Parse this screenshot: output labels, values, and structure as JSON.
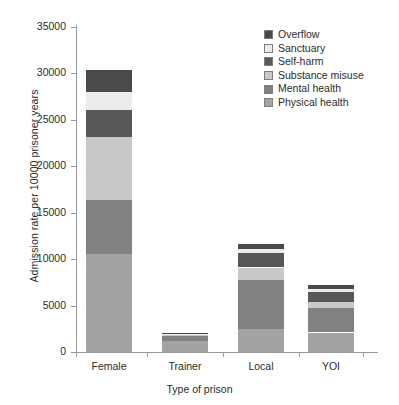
{
  "chart_data": {
    "type": "bar",
    "stacked": true,
    "title": "",
    "xlabel": "Type of prison",
    "ylabel": "Admission rate per 10000 prisoner years",
    "categories": [
      "Female",
      "Trainer",
      "Local",
      "YOI"
    ],
    "ylim": [
      0,
      35000
    ],
    "yticks": [
      0,
      5000,
      10000,
      15000,
      20000,
      25000,
      30000,
      35000
    ],
    "ytick_labels": [
      "0",
      "5000",
      "10000",
      "15000",
      "20000",
      "25000",
      "30000",
      "35000"
    ],
    "grid": false,
    "legend_position": "top-right",
    "legend_order_top_to_bottom": [
      "Overflow",
      "Sanctuary",
      "Self-harm",
      "Substance misuse",
      "Mental health",
      "Physical health"
    ],
    "stack_order_bottom_to_top": [
      "Physical health",
      "Mental health",
      "Substance misuse",
      "Self-harm",
      "Sanctuary",
      "Overflow"
    ],
    "series": [
      {
        "name": "Physical health",
        "color": "#a3a3a3",
        "values": [
          10600,
          1150,
          2500,
          2100
        ]
      },
      {
        "name": "Mental health",
        "color": "#828282",
        "values": [
          5800,
          550,
          5300,
          2600
        ]
      },
      {
        "name": "Substance misuse",
        "color": "#c8c8c8",
        "values": [
          6800,
          200,
          1300,
          700
        ]
      },
      {
        "name": "Self-harm",
        "color": "#585858",
        "values": [
          2900,
          60,
          1600,
          1100
        ]
      },
      {
        "name": "Sanctuary",
        "color": "#ececec",
        "values": [
          1900,
          20,
          400,
          300
        ]
      },
      {
        "name": "Overflow",
        "color": "#4a4a4a",
        "values": [
          2400,
          20,
          500,
          400
        ]
      }
    ],
    "totals": [
      30400,
      2000,
      11600,
      7200
    ]
  },
  "legend": {
    "items": [
      {
        "label": "Overflow",
        "color": "#4a4a4a"
      },
      {
        "label": "Sanctuary",
        "color": "#ececec"
      },
      {
        "label": "Self-harm",
        "color": "#585858"
      },
      {
        "label": "Substance misuse",
        "color": "#c8c8c8"
      },
      {
        "label": "Mental health",
        "color": "#828282"
      },
      {
        "label": "Physical health",
        "color": "#a3a3a3"
      }
    ]
  },
  "axes": {
    "ylabel": "Admission rate per 10000 prisoner years",
    "xlabel": "Type of prison"
  }
}
